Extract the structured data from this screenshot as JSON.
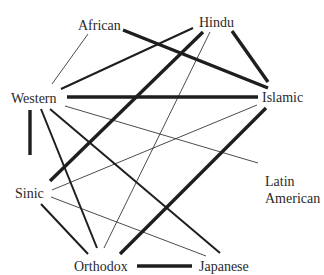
{
  "diagram": {
    "type": "network",
    "nodes": [
      {
        "id": "african",
        "label": "African"
      },
      {
        "id": "hindu",
        "label": "Hindu"
      },
      {
        "id": "western",
        "label": "Western"
      },
      {
        "id": "islamic",
        "label": "Islamic"
      },
      {
        "id": "latin",
        "label": "Latin American",
        "lines": [
          "Latin",
          "American"
        ]
      },
      {
        "id": "sinic",
        "label": "Sinic"
      },
      {
        "id": "orthodox",
        "label": "Orthodox"
      },
      {
        "id": "japanese",
        "label": "Japanese"
      }
    ],
    "edges": [
      {
        "from": "african",
        "to": "western",
        "weight": "thin"
      },
      {
        "from": "african",
        "to": "islamic",
        "weight": "thick"
      },
      {
        "from": "hindu",
        "to": "western",
        "weight": "medium"
      },
      {
        "from": "hindu",
        "to": "sinic",
        "weight": "thick"
      },
      {
        "from": "hindu",
        "to": "orthodox",
        "weight": "thin"
      },
      {
        "from": "hindu",
        "to": "islamic",
        "weight": "thick"
      },
      {
        "from": "western",
        "to": "islamic",
        "weight": "thick"
      },
      {
        "from": "western",
        "to": "latin",
        "weight": "thin"
      },
      {
        "from": "western",
        "to": "sinic",
        "weight": "thick"
      },
      {
        "from": "western",
        "to": "orthodox",
        "weight": "medium"
      },
      {
        "from": "western",
        "to": "japanese",
        "weight": "medium"
      },
      {
        "from": "islamic",
        "to": "sinic",
        "weight": "thin"
      },
      {
        "from": "islamic",
        "to": "orthodox",
        "weight": "thick"
      },
      {
        "from": "sinic",
        "to": "orthodox",
        "weight": "medium"
      },
      {
        "from": "sinic",
        "to": "japanese",
        "weight": "thin"
      },
      {
        "from": "orthodox",
        "to": "japanese",
        "weight": "thick"
      }
    ]
  }
}
